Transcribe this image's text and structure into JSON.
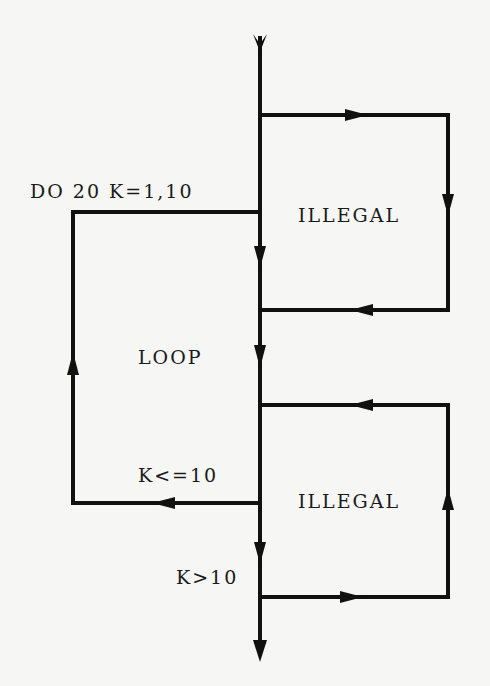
{
  "diagram": {
    "type": "flowchart",
    "colors": {
      "background": "#f6f6f4",
      "line": "#111111",
      "text": "#1a1a1a"
    },
    "labels": {
      "do_statement": "DO 20 K=1,10",
      "illegal_top": "ILLEGAL",
      "loop": "LOOP",
      "condition_continue": "K<=10",
      "illegal_bottom": "ILLEGAL",
      "condition_exit": "K>10"
    },
    "edges": [
      {
        "from": "entry",
        "to": "loop-start",
        "direction": "down"
      },
      {
        "from": "main-line",
        "to": "upper-illegal-loop",
        "label": "ILLEGAL",
        "note": "jump out of loop and back in"
      },
      {
        "from": "loop-end",
        "to": "loop-start",
        "label": "K<=10",
        "direction": "back-edge"
      },
      {
        "from": "main-line-after-loop",
        "to": "lower-illegal-loop",
        "label": "ILLEGAL",
        "note": "jump from outside back into loop"
      },
      {
        "from": "loop-end",
        "to": "exit",
        "label": "K>10",
        "direction": "down"
      }
    ]
  }
}
